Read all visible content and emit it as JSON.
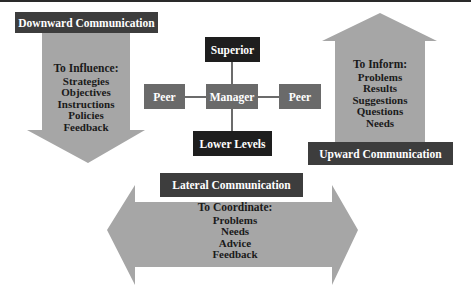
{
  "diagram": {
    "colors": {
      "arrow_fill": "#a6a6a6",
      "label_dark": "#3d3d3d",
      "label_black": "#1e1e1e",
      "peer_box": "#6a6a6a",
      "connector": "#3a3a3a"
    },
    "downward": {
      "label": "Downward Communication",
      "heading": "To Influence:",
      "items": [
        "Strategies",
        "Objectives",
        "Instructions",
        "Policies",
        "Feedback"
      ]
    },
    "upward": {
      "label": "Upward Communication",
      "heading": "To Inform:",
      "items": [
        "Problems",
        "Results",
        "Suggestions",
        "Questions",
        "Needs"
      ]
    },
    "lateral": {
      "label": "Lateral Communication",
      "heading": "To Coordinate:",
      "items": [
        "Problems",
        "Needs",
        "Advice",
        "Feedback"
      ]
    },
    "hierarchy": {
      "superior": "Superior",
      "manager": "Manager",
      "peer_left": "Peer",
      "peer_right": "Peer",
      "lower": "Lower Levels"
    }
  }
}
